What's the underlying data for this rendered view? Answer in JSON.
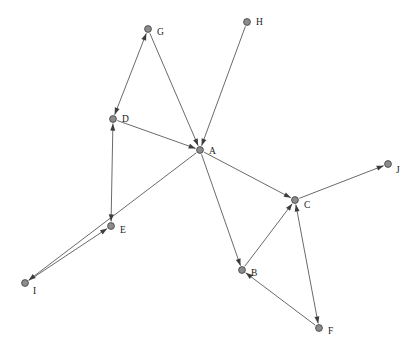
{
  "figure": {
    "type": "node-link-diagram",
    "background_color": "#ffffff",
    "node_fill_color": "#8c8c8c",
    "node_stroke_color": "#4a4a4a",
    "edge_color": "#595959",
    "arrow_color": "#3d3d3d",
    "label_color": "#1a1a1a",
    "width": 414,
    "height": 352
  },
  "nodes": [
    {
      "id": "A",
      "label": "A",
      "x": 200,
      "y": 150,
      "r": 3.4,
      "label_dx": 9,
      "label_dy": 2
    },
    {
      "id": "B",
      "label": "B",
      "x": 242,
      "y": 270,
      "r": 3.4,
      "label_dx": 9,
      "label_dy": 4
    },
    {
      "id": "C",
      "label": "C",
      "x": 295,
      "y": 200,
      "r": 3.4,
      "label_dx": 9,
      "label_dy": 6
    },
    {
      "id": "D",
      "label": "D",
      "x": 113,
      "y": 119,
      "r": 3.4,
      "label_dx": 9,
      "label_dy": 1
    },
    {
      "id": "E",
      "label": "E",
      "x": 111,
      "y": 226,
      "r": 3.4,
      "label_dx": 9,
      "label_dy": 5
    },
    {
      "id": "F",
      "label": "F",
      "x": 319,
      "y": 328,
      "r": 3.4,
      "label_dx": 9,
      "label_dy": 4
    },
    {
      "id": "G",
      "label": "G",
      "x": 148,
      "y": 29,
      "r": 3.4,
      "label_dx": 9,
      "label_dy": 4
    },
    {
      "id": "H",
      "label": "H",
      "x": 247,
      "y": 22,
      "r": 3.4,
      "label_dx": 9,
      "label_dy": 1
    },
    {
      "id": "I",
      "label": "I",
      "x": 25,
      "y": 283,
      "r": 3.4,
      "label_dx": 8,
      "label_dy": 9
    },
    {
      "id": "J",
      "label": "J",
      "x": 388,
      "y": 164,
      "r": 3.4,
      "label_dx": 8,
      "label_dy": 7
    }
  ],
  "edges": [
    {
      "from": "D",
      "to": "G",
      "directed": true,
      "bidirectional": true
    },
    {
      "from": "G",
      "to": "A",
      "directed": true,
      "bidirectional": false
    },
    {
      "from": "D",
      "to": "A",
      "directed": true,
      "bidirectional": false
    },
    {
      "from": "D",
      "to": "E",
      "directed": true,
      "bidirectional": true
    },
    {
      "from": "H",
      "to": "A",
      "directed": true,
      "bidirectional": false
    },
    {
      "from": "A",
      "to": "C",
      "directed": true,
      "bidirectional": false
    },
    {
      "from": "C",
      "to": "J",
      "directed": true,
      "bidirectional": false
    },
    {
      "from": "A",
      "to": "B",
      "directed": true,
      "bidirectional": false
    },
    {
      "from": "B",
      "to": "C",
      "directed": true,
      "bidirectional": false
    },
    {
      "from": "F",
      "to": "B",
      "directed": true,
      "bidirectional": false
    },
    {
      "from": "C",
      "to": "F",
      "directed": true,
      "bidirectional": true
    },
    {
      "from": "A",
      "to": "I",
      "directed": true,
      "bidirectional": false
    },
    {
      "from": "I",
      "to": "E",
      "directed": true,
      "bidirectional": false
    }
  ]
}
